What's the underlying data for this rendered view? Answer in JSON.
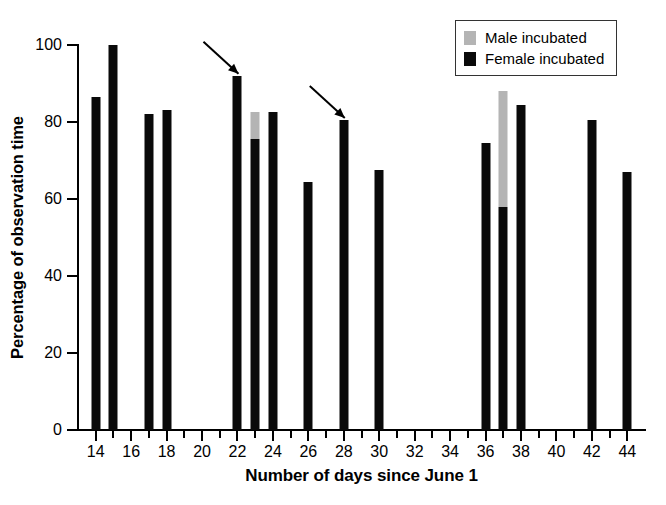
{
  "chart_data": {
    "type": "bar",
    "title": "",
    "xlabel": "Number of days since June 1",
    "ylabel": "Percentage of observation time",
    "xlim": [
      13,
      45
    ],
    "ylim": [
      0,
      100
    ],
    "grid": false,
    "stacked": true,
    "legend_position": "top-right",
    "y_ticks": [
      0,
      20,
      40,
      60,
      80,
      100
    ],
    "y_tick_labels": [
      "0",
      "20",
      "40",
      "60",
      "80",
      "100"
    ],
    "x_ticks_major": [
      14,
      16,
      18,
      20,
      22,
      24,
      26,
      28,
      30,
      32,
      34,
      36,
      38,
      40,
      42,
      44
    ],
    "x_tick_labels": [
      "14",
      "16",
      "18",
      "20",
      "22",
      "24",
      "26",
      "28",
      "30",
      "32",
      "34",
      "36",
      "38",
      "40",
      "42",
      "44"
    ],
    "x_ticks_minor": [
      15,
      17,
      19,
      21,
      23,
      25,
      27,
      29,
      31,
      33,
      35,
      37,
      39,
      41,
      43
    ],
    "categories": [
      14,
      15,
      17,
      18,
      22,
      23,
      24,
      26,
      28,
      30,
      36,
      37,
      38,
      42,
      44
    ],
    "series": [
      {
        "name": "Female incubated",
        "color": "#0a0a0a",
        "values": [
          86.5,
          100,
          82,
          83,
          92,
          75.5,
          82.5,
          64.5,
          80.5,
          67.5,
          74.5,
          58,
          84.5,
          80.5,
          67
        ]
      },
      {
        "name": "Male incubated",
        "color": "#b4b4b4",
        "values": [
          0,
          0,
          0,
          0,
          0,
          7,
          0,
          0,
          0,
          0,
          0,
          30,
          0,
          0,
          0
        ]
      }
    ],
    "bars": [
      {
        "day": 14,
        "female": 86.5,
        "male": 0,
        "total": 86.5
      },
      {
        "day": 15,
        "female": 100,
        "male": 0,
        "total": 100
      },
      {
        "day": 17,
        "female": 82,
        "male": 0,
        "total": 82
      },
      {
        "day": 18,
        "female": 83,
        "male": 0,
        "total": 83
      },
      {
        "day": 22,
        "female": 92,
        "male": 0,
        "total": 92
      },
      {
        "day": 23,
        "female": 75.5,
        "male": 7,
        "total": 82.5
      },
      {
        "day": 24,
        "female": 82.5,
        "male": 0,
        "total": 82.5
      },
      {
        "day": 26,
        "female": 64.5,
        "male": 0,
        "total": 64.5
      },
      {
        "day": 28,
        "female": 80.5,
        "male": 0,
        "total": 80.5
      },
      {
        "day": 30,
        "female": 67.5,
        "male": 0,
        "total": 67.5
      },
      {
        "day": 36,
        "female": 74.5,
        "male": 0,
        "total": 74.5
      },
      {
        "day": 37,
        "female": 58,
        "male": 30,
        "total": 88
      },
      {
        "day": 38,
        "female": 84.5,
        "male": 0,
        "total": 84.5
      },
      {
        "day": 42,
        "female": 80.5,
        "male": 0,
        "total": 80.5
      },
      {
        "day": 44,
        "female": 67,
        "male": 0,
        "total": 67
      }
    ],
    "annotations": [
      {
        "name": "arrow-day-22",
        "points_to_day": 22,
        "points_to_value": 92,
        "style": "diagonal-arrow-from-upper-left"
      },
      {
        "name": "arrow-day-28",
        "points_to_day": 28,
        "points_to_value": 80.5,
        "style": "diagonal-arrow-from-upper-left"
      }
    ]
  },
  "legend": {
    "items": [
      {
        "label": "Male incubated",
        "color": "#b4b4b4",
        "icon": "gray-square-swatch"
      },
      {
        "label": "Female incubated",
        "color": "#0a0a0a",
        "icon": "black-square-swatch"
      }
    ]
  },
  "colors": {
    "male": "#b4b4b4",
    "female": "#0a0a0a",
    "axis": "#000000",
    "background": "#ffffff"
  }
}
